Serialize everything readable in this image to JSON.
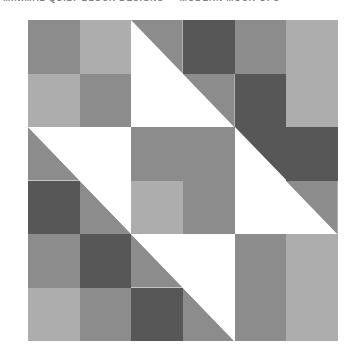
{
  "header": {
    "caption": "MINIMAL QUILT BLOCK DESIGNS — MODERN MOCK-UPS"
  },
  "palette": {
    "white": "#FFFFFF",
    "light": "#ADADAD",
    "medium": "#8C8C8C",
    "dark": "#575757",
    "background": "#FFFFFF",
    "caption_color": "#7E7E86"
  },
  "quilt": {
    "name": "diagonal-zigzag-quilt-block",
    "columns": 6,
    "rows": 6,
    "cell_labels": {
      "solid_white": "white square",
      "solid_light": "light gray square",
      "solid_medium": "medium gray square",
      "solid_dark": "dark gray square",
      "hst_white_bl_medium_tr": "half-square triangle, white lower-left / medium gray upper-right",
      "hst_white_tr_medium_bl": "half-square triangle, white upper-right / medium gray lower-left",
      "hst_white_bl_dark_tr": "half-square triangle, white lower-left / dark gray upper-right",
      "hst_white_tr_dark_bl": "half-square triangle, white upper-right / dark gray lower-left"
    },
    "cells": [
      [
        {
          "kind": "solid",
          "color": "#8C8C8C",
          "label": "medium gray square"
        },
        {
          "kind": "solid",
          "color": "#ADADAD",
          "label": "light gray square"
        },
        {
          "kind": "hst",
          "orientation": "white-bl",
          "a": "#FFFFFF",
          "b": "#8C8C8C",
          "label": "half-square triangle, white lower-left / medium gray upper-right"
        },
        {
          "kind": "solid",
          "color": "#575757",
          "label": "dark gray square"
        },
        {
          "kind": "solid",
          "color": "#8C8C8C",
          "label": "medium gray square"
        },
        {
          "kind": "solid",
          "color": "#ADADAD",
          "label": "light gray square"
        }
      ],
      [
        {
          "kind": "solid",
          "color": "#ADADAD",
          "label": "light gray square"
        },
        {
          "kind": "solid",
          "color": "#8C8C8C",
          "label": "medium gray square"
        },
        {
          "kind": "solid",
          "color": "#FFFFFF",
          "label": "white square"
        },
        {
          "kind": "hst",
          "orientation": "white-bl",
          "a": "#FFFFFF",
          "b": "#8C8C8C",
          "label": "half-square triangle, white lower-left / medium gray upper-right"
        },
        {
          "kind": "solid",
          "color": "#575757",
          "label": "dark gray square"
        },
        {
          "kind": "solid",
          "color": "#ADADAD",
          "label": "light gray square"
        }
      ],
      [
        {
          "kind": "hst",
          "orientation": "white-tr",
          "a": "#FFFFFF",
          "b": "#8C8C8C",
          "label": "half-square triangle, white upper-right / medium gray lower-left"
        },
        {
          "kind": "solid",
          "color": "#FFFFFF",
          "label": "white square"
        },
        {
          "kind": "solid",
          "color": "#8C8C8C",
          "label": "medium gray square"
        },
        {
          "kind": "solid",
          "color": "#8C8C8C",
          "label": "medium gray square"
        },
        {
          "kind": "hst",
          "orientation": "white-bl",
          "a": "#FFFFFF",
          "b": "#575757",
          "label": "half-square triangle, white lower-left / dark gray upper-right"
        },
        {
          "kind": "solid",
          "color": "#575757",
          "label": "dark gray square"
        }
      ],
      [
        {
          "kind": "solid",
          "color": "#575757",
          "label": "dark gray square"
        },
        {
          "kind": "hst",
          "orientation": "white-tr",
          "a": "#FFFFFF",
          "b": "#8C8C8C",
          "label": "half-square triangle, white upper-right / medium gray lower-left"
        },
        {
          "kind": "solid",
          "color": "#ADADAD",
          "label": "light gray square"
        },
        {
          "kind": "solid",
          "color": "#8C8C8C",
          "label": "medium gray square"
        },
        {
          "kind": "solid",
          "color": "#FFFFFF",
          "label": "white square"
        },
        {
          "kind": "hst",
          "orientation": "white-bl",
          "a": "#FFFFFF",
          "b": "#8C8C8C",
          "label": "half-square triangle, white lower-left / medium gray upper-right"
        }
      ],
      [
        {
          "kind": "solid",
          "color": "#8C8C8C",
          "label": "medium gray square"
        },
        {
          "kind": "solid",
          "color": "#575757",
          "label": "dark gray square"
        },
        {
          "kind": "hst",
          "orientation": "white-tr",
          "a": "#FFFFFF",
          "b": "#8C8C8C",
          "label": "half-square triangle, white upper-right / medium gray lower-left"
        },
        {
          "kind": "solid",
          "color": "#FFFFFF",
          "label": "white square"
        },
        {
          "kind": "solid",
          "color": "#8C8C8C",
          "label": "medium gray square"
        },
        {
          "kind": "solid",
          "color": "#ADADAD",
          "label": "light gray square"
        }
      ],
      [
        {
          "kind": "solid",
          "color": "#ADADAD",
          "label": "light gray square"
        },
        {
          "kind": "solid",
          "color": "#8C8C8C",
          "label": "medium gray square"
        },
        {
          "kind": "solid",
          "color": "#575757",
          "label": "dark gray square"
        },
        {
          "kind": "hst",
          "orientation": "white-tr",
          "a": "#FFFFFF",
          "b": "#8C8C8C",
          "label": "half-square triangle, white upper-right / medium gray lower-left"
        },
        {
          "kind": "solid",
          "color": "#8C8C8C",
          "label": "medium gray square"
        },
        {
          "kind": "solid",
          "color": "#ADADAD",
          "label": "light gray square"
        }
      ]
    ]
  }
}
